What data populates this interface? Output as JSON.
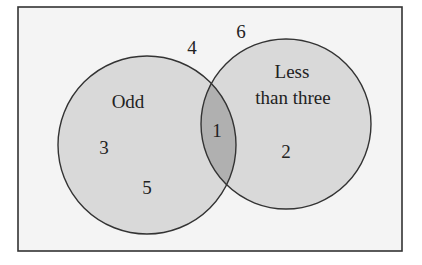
{
  "diagram": {
    "type": "venn",
    "universe": {
      "elements_outside": [
        "4",
        "6"
      ]
    },
    "sets": [
      {
        "name": "Odd",
        "label_lines": [
          "Odd"
        ],
        "only_elements": [
          "3",
          "5"
        ]
      },
      {
        "name": "Less than three",
        "label_lines": [
          "Less",
          "than three"
        ],
        "only_elements": [
          "2"
        ]
      }
    ],
    "intersection": {
      "elements": [
        "1"
      ]
    },
    "colors": {
      "background": "#f4f4f4",
      "circle_fill": "#d9d9d9",
      "intersection_fill": "#b0b0b0",
      "stroke": "#333333"
    }
  }
}
